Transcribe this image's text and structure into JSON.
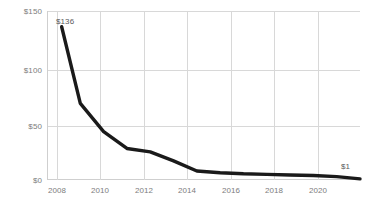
{
  "chart_data": {
    "type": "line",
    "title": "",
    "subtitle": "",
    "xlabel": "",
    "ylabel": "",
    "xlim": [
      2008,
      2021
    ],
    "ylim": [
      0,
      150
    ],
    "grid": true,
    "legend": false,
    "legend_position": "none",
    "line_color": "#1a1a1a",
    "grid_color": "#d8d8d8",
    "tick_label_color": "#7d7d7d",
    "x": [
      2008.2,
      2009,
      2010,
      2011,
      2012,
      2013,
      2014,
      2015,
      2016,
      2017,
      2018,
      2019,
      2020,
      2021
    ],
    "values": [
      136,
      68,
      43,
      28,
      25,
      17,
      8,
      6.5,
      5.5,
      5,
      4.5,
      4,
      3,
      1
    ],
    "series": [
      {
        "name": "cost",
        "values": [
          136,
          68,
          43,
          28,
          25,
          17,
          8,
          6.5,
          5.5,
          5,
          4.5,
          4,
          3,
          1
        ]
      }
    ],
    "ytick_labels": [
      "$150",
      "$100",
      "$50",
      "$0"
    ],
    "ytick_values": [
      150,
      100,
      50,
      0
    ],
    "xtick_labels": [
      "2008",
      "2010",
      "2012",
      "2014",
      "2016",
      "2018",
      "2020"
    ],
    "xtick_values": [
      2008,
      2010,
      2012,
      2014,
      2016,
      2018,
      2020
    ],
    "annotations": [
      {
        "name": "start-value",
        "text": "$136",
        "x": 2008.2,
        "y": 136
      },
      {
        "name": "end-value",
        "text": "$1",
        "x": 2021,
        "y": 1
      }
    ]
  }
}
